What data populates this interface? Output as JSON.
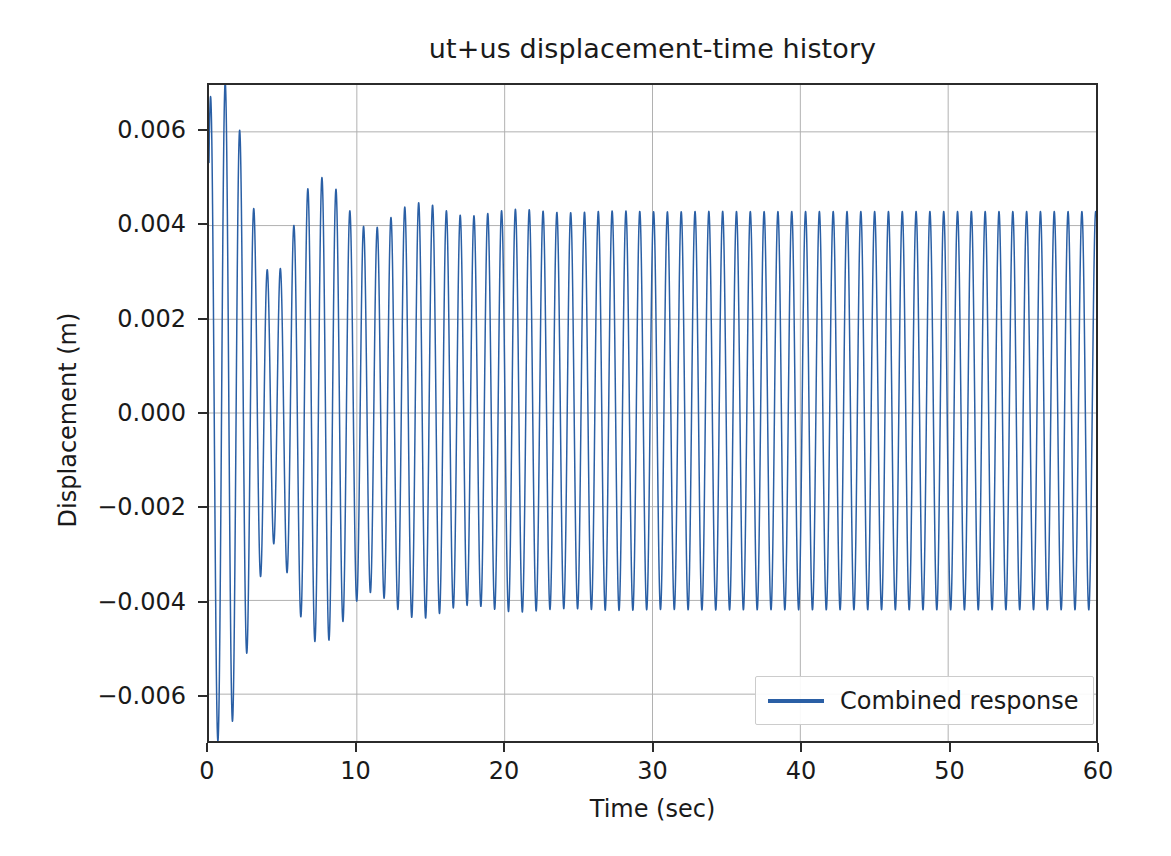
{
  "chart_data": {
    "type": "line",
    "title": "ut+us displacement-time history",
    "xlabel": "Time (sec)",
    "ylabel": "Displacement (m)",
    "xlim": [
      0,
      60
    ],
    "ylim": [
      -0.007,
      0.007
    ],
    "xticks": [
      0,
      10,
      20,
      30,
      40,
      50,
      60
    ],
    "xtick_labels": [
      "0",
      "10",
      "20",
      "30",
      "40",
      "50",
      "60"
    ],
    "yticks": [
      0.006,
      0.004,
      0.002,
      0.0,
      -0.002,
      -0.004,
      -0.006
    ],
    "ytick_labels": [
      "0.006",
      "0.004",
      "0.002",
      "0.000",
      "−0.002",
      "−0.004",
      "−0.006"
    ],
    "grid": true,
    "grid_color": "#b0b0b0",
    "legend": {
      "position": "lower right",
      "entries": [
        {
          "name": "Combined response",
          "color": "#2a5fa5"
        }
      ]
    },
    "series": [
      {
        "name": "Combined response",
        "color": "#2a5fa5",
        "linewidth": 1.5,
        "description": "Damped structural response: initial transient beating decaying into steady-state harmonic oscillation",
        "model": {
          "steady_amplitude": 0.00425,
          "steady_offset": 5e-05,
          "steady_frequency_hz": 1.07,
          "steady_phase_rad": 0.45,
          "transient_amplitude": 0.00345,
          "transient_frequency_hz": 0.92,
          "transient_phase_rad": 1.55,
          "transient_damping_ratio": 0.035,
          "t_start": 0,
          "t_end": 60,
          "samples": 7000
        },
        "notable_points": [
          {
            "t": 0.0,
            "y": 0.0
          },
          {
            "t": 0.35,
            "y": 0.0034
          },
          {
            "t": 1.25,
            "y": 0.0067
          },
          {
            "t": 0.9,
            "y": -0.0058
          },
          {
            "t": 1.85,
            "y": -0.006
          },
          {
            "t": 4.4,
            "y": 0.0058
          },
          {
            "t": 4.9,
            "y": -0.0057
          },
          {
            "t": 6.6,
            "y": 0.0048
          },
          {
            "t": 7.2,
            "y": -0.0047
          },
          {
            "t": 9.6,
            "y": 0.0049
          },
          {
            "t": 10.4,
            "y": -0.0048
          },
          {
            "t": 13.7,
            "y": 0.0047
          },
          {
            "t": 20.0,
            "y": 0.0043
          },
          {
            "t": 30.0,
            "y": 0.0043
          },
          {
            "t": 40.0,
            "y": 0.0043
          },
          {
            "t": 50.0,
            "y": 0.0043
          },
          {
            "t": 59.5,
            "y": 0.0043
          }
        ]
      }
    ]
  }
}
